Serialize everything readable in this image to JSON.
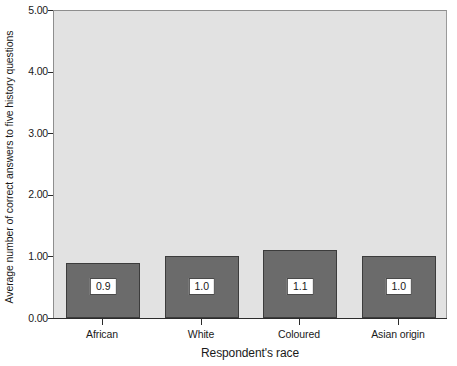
{
  "chart_data": {
    "type": "bar",
    "title": "",
    "subtitle": "",
    "xlabel": "Respondent's race",
    "ylabel": "Average number of correct answers to five history questions",
    "categories": [
      "African",
      "White",
      "Coloured",
      "Asian origin"
    ],
    "values": [
      0.9,
      1.0,
      1.1,
      1.0
    ],
    "value_labels": [
      "0.9",
      "1.0",
      "1.1",
      "1.0"
    ],
    "ylim": [
      0.0,
      5.0
    ],
    "ytick_values": [
      5.0,
      4.0,
      3.0,
      2.0,
      1.0,
      0.0
    ],
    "ytick_labels": [
      "5.00",
      "4.00",
      "3.00",
      "2.00",
      "1.00",
      "0.00"
    ],
    "grid": false,
    "legend": null,
    "legend_position": "none",
    "colors": {
      "bar_fill": "#6b6b6b",
      "bar_edge": "#3c3c3c",
      "plot_background": "#e2e2e2",
      "figure_background": "#ffffff",
      "axis": "#2b2b2b",
      "label_box_fill": "#ffffff",
      "label_box_edge": "#4a4a4a",
      "text": "#1a1a1a"
    }
  }
}
